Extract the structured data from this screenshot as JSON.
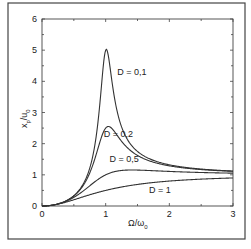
{
  "chart_data": {
    "type": "line",
    "title": "",
    "xlabel": "Ω/ω0",
    "ylabel": "x̂p/û0",
    "xlim": [
      0,
      3
    ],
    "ylim": [
      0,
      6
    ],
    "xticks": [
      "0",
      "1",
      "2",
      "3"
    ],
    "yticks": [
      "0",
      "1",
      "2",
      "3",
      "4",
      "5",
      "6"
    ],
    "grid": false,
    "legend": "inline labels",
    "series": [
      {
        "name": "D = 0,1",
        "damping": 0.1,
        "peak": 5.0
      },
      {
        "name": "D = 0,2",
        "damping": 0.2,
        "peak": 2.5
      },
      {
        "name": "D = 0,5",
        "damping": 0.5,
        "peak": 1.15
      },
      {
        "name": "D = 1",
        "damping": 1.0,
        "peak": 0.9
      }
    ],
    "labels": [
      {
        "text": "D = 0,1",
        "x": 1.18,
        "y": 4.2
      },
      {
        "text": "D = 0,2",
        "x": 0.97,
        "y": 2.2
      },
      {
        "text": "D = 0,5",
        "x": 1.06,
        "y": 1.42
      },
      {
        "text": "D = 1",
        "x": 1.68,
        "y": 0.42
      }
    ]
  },
  "axis": {
    "x_title_main": "Ω/ω",
    "x_title_sub": "0",
    "y_title_main": "x",
    "y_title_sub1": "p",
    "y_title_mid": "/u",
    "y_title_sub2": "0"
  }
}
